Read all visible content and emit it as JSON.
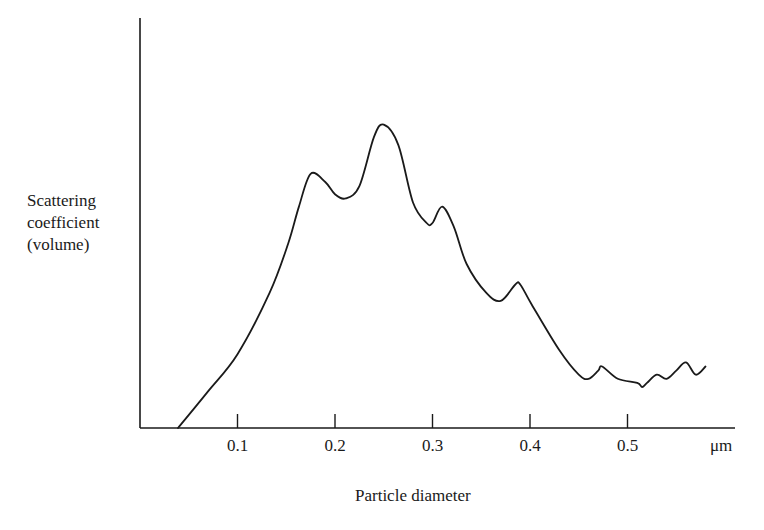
{
  "chart_data": {
    "type": "line",
    "title": "",
    "xlabel": "Particle diameter",
    "xunit": "μm",
    "ylabel": "Scattering coefficient (volume)",
    "ylabel_lines": [
      "Scattering",
      "coefficient",
      "(volume)"
    ],
    "xlim": [
      0,
      0.6
    ],
    "ylim": [
      0,
      100
    ],
    "yticks": [],
    "xticks": [
      0.1,
      0.2,
      0.3,
      0.4,
      0.5
    ],
    "xtick_labels": [
      "0.1",
      "0.2",
      "0.3",
      "0.4",
      "0.5"
    ],
    "grid": false,
    "legend": null,
    "series": [
      {
        "name": "Scattering coefficient",
        "color": "#1a1a1a",
        "x": [
          0.039,
          0.07,
          0.1,
          0.133,
          0.152,
          0.163,
          0.175,
          0.19,
          0.2,
          0.211,
          0.225,
          0.24,
          0.25,
          0.265,
          0.28,
          0.294,
          0.3,
          0.31,
          0.322,
          0.335,
          0.355,
          0.37,
          0.385,
          0.39,
          0.402,
          0.43,
          0.45,
          0.46,
          0.47,
          0.474,
          0.49,
          0.51,
          0.515,
          0.52,
          0.53,
          0.54,
          0.55,
          0.56,
          0.57,
          0.58
        ],
        "y": [
          0,
          9,
          18,
          33,
          45,
          54,
          62,
          60,
          57,
          56,
          59,
          71,
          74,
          69,
          55,
          50,
          50,
          54,
          49,
          40,
          33,
          31,
          35,
          35,
          30,
          19,
          13,
          12,
          14,
          15,
          12,
          11,
          10,
          11,
          13,
          12,
          14,
          16,
          13,
          15
        ]
      }
    ],
    "layout": {
      "axes": "left-bottom only, no top/right spine",
      "y_axis_ticks": "none"
    }
  }
}
